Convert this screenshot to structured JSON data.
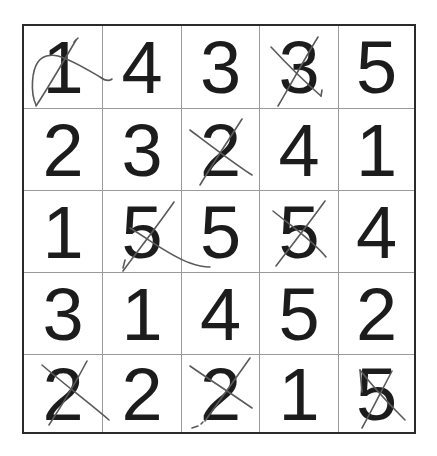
{
  "puzzle": {
    "rows": [
      {
        "cells": [
          {
            "value": "1",
            "crossed": true
          },
          {
            "value": "4",
            "crossed": false
          },
          {
            "value": "3",
            "crossed": false
          },
          {
            "value": "3",
            "crossed": true
          },
          {
            "value": "5",
            "crossed": false
          }
        ]
      },
      {
        "cells": [
          {
            "value": "2",
            "crossed": false
          },
          {
            "value": "3",
            "crossed": false
          },
          {
            "value": "2",
            "crossed": true
          },
          {
            "value": "4",
            "crossed": false
          },
          {
            "value": "1",
            "crossed": false
          }
        ]
      },
      {
        "cells": [
          {
            "value": "1",
            "crossed": false
          },
          {
            "value": "5",
            "crossed": true
          },
          {
            "value": "5",
            "crossed": false
          },
          {
            "value": "5",
            "crossed": true
          },
          {
            "value": "4",
            "crossed": false
          }
        ]
      },
      {
        "cells": [
          {
            "value": "3",
            "crossed": false
          },
          {
            "value": "1",
            "crossed": false
          },
          {
            "value": "4",
            "crossed": false
          },
          {
            "value": "5",
            "crossed": false
          },
          {
            "value": "2",
            "crossed": false
          }
        ]
      },
      {
        "cells": [
          {
            "value": "2",
            "crossed": true
          },
          {
            "value": "2",
            "crossed": false
          },
          {
            "value": "2",
            "crossed": true
          },
          {
            "value": "1",
            "crossed": false
          },
          {
            "value": "5",
            "crossed": true
          }
        ]
      }
    ]
  },
  "colors": {
    "digit": "#1c1c1c",
    "outer_border": "#2a2a2a",
    "grid_line": "#9a9a9a",
    "pencil_mark": "#5a5a5a",
    "background": "#ffffff"
  }
}
